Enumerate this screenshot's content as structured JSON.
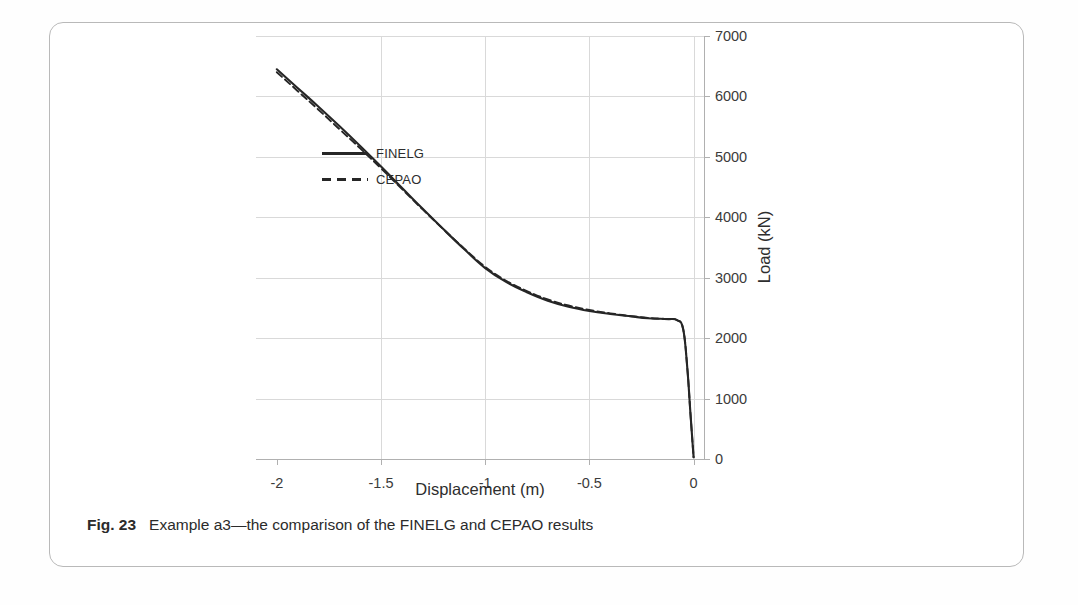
{
  "figure": {
    "caption_label": "Fig. 23",
    "caption_text": "Example a3—the comparison of the FINELG and CEPAO results"
  },
  "chart_data": {
    "type": "line",
    "title": "",
    "subtitle": "",
    "xlabel": "Displacement (m)",
    "ylabel": "Load (kN)",
    "xlim": [
      -2.1,
      0.05
    ],
    "ylim": [
      0,
      7000
    ],
    "xticks": [
      -2,
      -1.5,
      -1,
      -0.5,
      0
    ],
    "xtick_labels": [
      "-2",
      "-1.5",
      "-1",
      "-0.5",
      "0"
    ],
    "yticks": [
      0,
      1000,
      2000,
      3000,
      4000,
      5000,
      6000,
      7000
    ],
    "ytick_labels": [
      "0",
      "1000",
      "2000",
      "3000",
      "4000",
      "5000",
      "6000",
      "7000"
    ],
    "grid": true,
    "grid_color": "#d9d9d9",
    "legend_position": "inside-upper-center",
    "line_color": "#262626",
    "series": [
      {
        "name": "FINELG",
        "style": "solid",
        "x": [
          -2.0,
          -1.9,
          -1.8,
          -1.7,
          -1.6,
          -1.5,
          -1.4,
          -1.3,
          -1.2,
          -1.1,
          -1.0,
          -0.9,
          -0.8,
          -0.7,
          -0.6,
          -0.5,
          -0.4,
          -0.3,
          -0.22,
          -0.16,
          -0.12,
          -0.08,
          -0.05,
          -0.03,
          -0.015,
          0.0
        ],
        "y": [
          6450,
          6140,
          5830,
          5510,
          5180,
          4840,
          4490,
          4140,
          3800,
          3470,
          3160,
          2930,
          2760,
          2620,
          2520,
          2450,
          2400,
          2360,
          2330,
          2320,
          2315,
          2300,
          2150,
          1500,
          750,
          30
        ]
      },
      {
        "name": "CEPAO",
        "style": "dashed",
        "x": [
          -2.0,
          -1.9,
          -1.8,
          -1.7,
          -1.6,
          -1.5,
          -1.4,
          -1.3,
          -1.2,
          -1.1,
          -1.0,
          -0.9,
          -0.8,
          -0.7,
          -0.6,
          -0.5,
          -0.4,
          -0.3,
          -0.22,
          -0.16,
          -0.12,
          -0.08,
          -0.05,
          -0.03,
          -0.015,
          0.0
        ],
        "y": [
          6400,
          6090,
          5780,
          5460,
          5140,
          4810,
          4470,
          4130,
          3800,
          3480,
          3180,
          2950,
          2780,
          2640,
          2540,
          2465,
          2410,
          2365,
          2335,
          2322,
          2316,
          2300,
          2150,
          1500,
          750,
          30
        ]
      }
    ],
    "legend": [
      {
        "label": "FINELG",
        "style": "solid"
      },
      {
        "label": "CEPAO",
        "style": "dashed"
      }
    ]
  }
}
